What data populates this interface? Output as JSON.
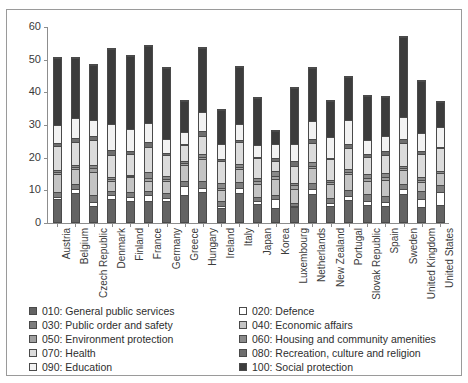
{
  "chart_data": {
    "type": "bar",
    "subtype": "stacked-bar",
    "title": "",
    "xlabel": "",
    "ylabel": "",
    "ylim": [
      0,
      60
    ],
    "yticks": [
      0,
      10,
      20,
      30,
      40,
      50,
      60
    ],
    "grid": false,
    "legend_position": "bottom",
    "categories": [
      "Austria",
      "Belgium",
      "Czech Republic",
      "Denmark",
      "Finland",
      "France",
      "Germany",
      "Greece",
      "Hungary",
      "Ireland",
      "Italy",
      "Japan",
      "Korea",
      "Luxembourg",
      "Netherlands",
      "New Zealand",
      "Portugal",
      "Slovak Republic",
      "Spain",
      "Sweden",
      "United Kingdom",
      "United States"
    ],
    "series": [
      {
        "name": "010: General public services",
        "color": "#636363",
        "values": [
          6.9,
          8.9,
          4.8,
          7.0,
          6.3,
          6.4,
          6.3,
          8.2,
          9.2,
          4.2,
          9.0,
          5.5,
          4.4,
          4.5,
          8.5,
          5.0,
          6.7,
          5.1,
          4.9,
          8.5,
          4.5,
          5.2
        ]
      },
      {
        "name": "020: Defence",
        "color": "#ffffff",
        "values": [
          0.8,
          1.1,
          1.3,
          1.4,
          1.4,
          1.9,
          1.1,
          2.9,
          1.3,
          0.6,
          1.3,
          0.9,
          2.5,
          0.3,
          1.5,
          0.9,
          1.3,
          1.4,
          1.1,
          1.7,
          2.4,
          4.1
        ]
      },
      {
        "name": "030: Public order and safety",
        "color": "#7d7d7d",
        "values": [
          1.5,
          1.6,
          2.2,
          1.0,
          1.4,
          1.2,
          1.6,
          1.4,
          2.1,
          1.5,
          1.9,
          1.3,
          1.3,
          1.0,
          1.8,
          1.4,
          1.9,
          2.1,
          1.9,
          1.3,
          2.5,
          2.1
        ]
      },
      {
        "name": "040: Economic affairs",
        "color": "#c4c4c4",
        "values": [
          5.5,
          4.6,
          7.0,
          3.3,
          4.7,
          3.1,
          3.5,
          5.1,
          6.6,
          3.4,
          4.0,
          3.8,
          5.1,
          4.3,
          4.7,
          4.4,
          4.7,
          4.1,
          5.1,
          4.5,
          2.8,
          3.5
        ]
      },
      {
        "name": "050: Environment protection",
        "color": "#a0a0a0",
        "values": [
          0.6,
          0.7,
          1.1,
          0.5,
          0.3,
          0.9,
          0.6,
          0.6,
          0.7,
          0.8,
          0.8,
          1.2,
          0.9,
          1.2,
          0.8,
          0.6,
          0.7,
          0.8,
          0.9,
          0.4,
          0.7,
          0.0
        ]
      },
      {
        "name": "060: Housing and community amenities",
        "color": "#8a8a8a",
        "values": [
          0.6,
          0.6,
          1.2,
          0.5,
          0.4,
          1.8,
          1.0,
          0.5,
          0.9,
          1.6,
          0.7,
          0.7,
          1.3,
          0.7,
          1.0,
          0.7,
          0.8,
          1.1,
          1.0,
          0.8,
          0.8,
          0.6
        ]
      },
      {
        "name": "070: Health",
        "color": "#dcdcdc",
        "values": [
          7.3,
          6.9,
          7.5,
          6.8,
          6.3,
          7.6,
          6.4,
          4.8,
          5.4,
          6.6,
          6.7,
          6.2,
          3.3,
          5.1,
          5.8,
          6.4,
          6.7,
          5.4,
          5.5,
          6.9,
          7.0,
          7.1
        ]
      },
      {
        "name": "080: Recreation, culture and religion",
        "color": "#6e6e6e",
        "values": [
          0.9,
          1.3,
          1.2,
          1.7,
          1.1,
          1.5,
          0.7,
          0.4,
          1.6,
          0.7,
          0.8,
          0.3,
          0.7,
          1.5,
          1.4,
          0.3,
          1.0,
          0.9,
          1.5,
          1.2,
          1.0,
          0.3
        ]
      },
      {
        "name": "090: Education",
        "color": "#f2f2f2",
        "values": [
          5.6,
          6.2,
          5.0,
          7.9,
          6.5,
          6.0,
          4.1,
          3.8,
          5.8,
          4.6,
          4.8,
          3.7,
          4.5,
          5.2,
          5.3,
          6.3,
          7.4,
          4.1,
          4.4,
          7.0,
          5.7,
          6.2
        ]
      },
      {
        "name": "100: Social protection",
        "color": "#3c3c3c",
        "values": [
          20.6,
          18.2,
          16.7,
          22.9,
          22.4,
          23.6,
          21.8,
          9.5,
          19.8,
          10.3,
          17.5,
          14.5,
          4.0,
          17.2,
          16.5,
          11.0,
          13.2,
          13.6,
          12.1,
          24.4,
          15.9,
          7.6
        ]
      }
    ]
  },
  "legend": {
    "left_column": [
      {
        "label": "010: General public services",
        "color": "#636363"
      },
      {
        "label": "030: Public order and safety",
        "color": "#7d7d7d"
      },
      {
        "label": "050: Environment protection",
        "color": "#a0a0a0"
      },
      {
        "label": "070: Health",
        "color": "#dcdcdc"
      },
      {
        "label": "090: Education",
        "color": "#f2f2f2"
      }
    ],
    "right_column": [
      {
        "label": "020: Defence",
        "color": "#ffffff"
      },
      {
        "label": "040: Economic affairs",
        "color": "#c4c4c4"
      },
      {
        "label": "060: Housing and community amenities",
        "color": "#8a8a8a"
      },
      {
        "label": "080: Recreation, culture and religion",
        "color": "#6e6e6e"
      },
      {
        "label": "100: Social protection",
        "color": "#3c3c3c"
      }
    ]
  },
  "top_fragment": ""
}
